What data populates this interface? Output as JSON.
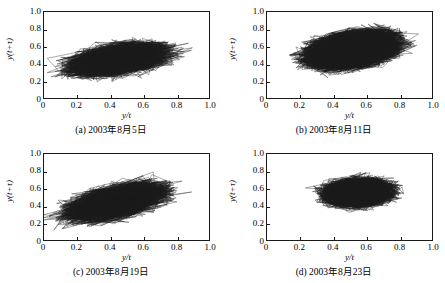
{
  "figure": {
    "width": 445,
    "height": 283,
    "background": "#ffffff",
    "ink": "#1a1a1a"
  },
  "axes": {
    "xlabel": "y/t",
    "ylabel": "y(t+τ)",
    "xticks": [
      "0",
      "0.2",
      "0.4",
      "0.6",
      "0.8",
      "1.0"
    ],
    "yticks": [
      "0",
      "0.2",
      "0.4",
      "0.6",
      "0.8",
      "1.0"
    ],
    "xlim": [
      0,
      1
    ],
    "ylim": [
      0,
      1
    ]
  },
  "chart_data": {
    "type": "scatter",
    "title": "",
    "xlabel": "y/t",
    "ylabel": "y(t+τ)",
    "xlim": [
      0,
      1
    ],
    "ylim": [
      0,
      1
    ],
    "xticks": [
      0,
      0.2,
      0.4,
      0.6,
      0.8,
      1.0
    ],
    "yticks": [
      0,
      0.2,
      0.4,
      0.6,
      0.8,
      1.0
    ],
    "grid": false,
    "legend": "none",
    "plot_style": "connected-trajectory phase-space attractor, thin black lines",
    "panels": [
      {
        "id": "a",
        "caption": "(a) 2003年8月5日",
        "date": "2003-08-05",
        "attractor": {
          "center": [
            0.45,
            0.45
          ],
          "major_axis": 0.52,
          "minor_axis": 0.27,
          "angle_deg": 22,
          "core_fill_ratio": 0.58,
          "outlier_spread": 1.55,
          "n_points": 2200,
          "x_range": [
            0.02,
            0.99
          ],
          "y_range": [
            0.02,
            0.99
          ]
        }
      },
      {
        "id": "b",
        "caption": "(b) 2003年8月11日",
        "date": "2003-08-11",
        "attractor": {
          "center": [
            0.52,
            0.56
          ],
          "major_axis": 0.6,
          "minor_axis": 0.38,
          "angle_deg": 26,
          "core_fill_ratio": 0.72,
          "outlier_spread": 1.3,
          "n_points": 2600,
          "x_range": [
            0.06,
            1.0
          ],
          "y_range": [
            0.1,
            1.0
          ]
        }
      },
      {
        "id": "c",
        "caption": "(c) 2003年8月19日",
        "date": "2003-08-19",
        "attractor": {
          "center": [
            0.44,
            0.44
          ],
          "major_axis": 0.56,
          "minor_axis": 0.28,
          "angle_deg": 30,
          "core_fill_ratio": 0.62,
          "outlier_spread": 1.5,
          "n_points": 2400,
          "x_range": [
            0.0,
            1.0
          ],
          "y_range": [
            0.0,
            1.0
          ]
        }
      },
      {
        "id": "d",
        "caption": "(d) 2003年8月23日",
        "date": "2003-08-23",
        "attractor": {
          "center": [
            0.55,
            0.55
          ],
          "major_axis": 0.4,
          "minor_axis": 0.3,
          "angle_deg": 12,
          "core_fill_ratio": 0.66,
          "outlier_spread": 1.35,
          "n_points": 2000,
          "x_range": [
            0.17,
            0.93
          ],
          "y_range": [
            0.17,
            0.94
          ]
        }
      }
    ]
  }
}
